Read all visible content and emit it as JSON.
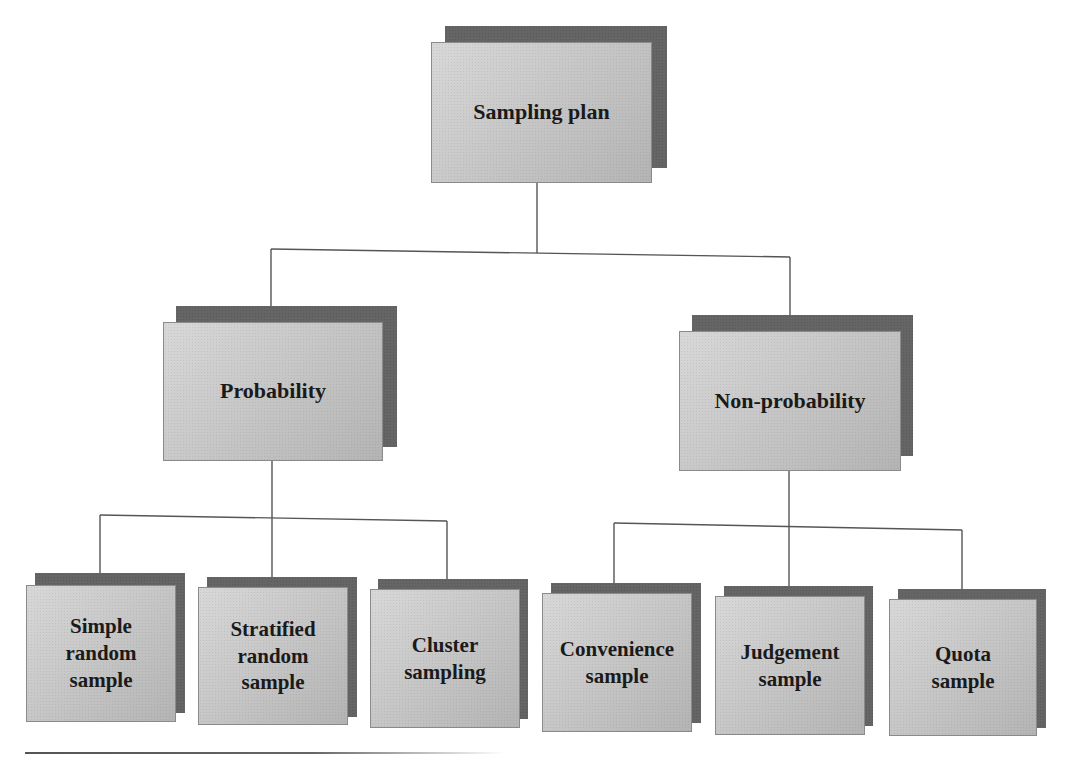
{
  "diagram": {
    "type": "hierarchy-tree",
    "colors": {
      "box_fill": "#c6c6c6",
      "box_shadow": "#656565",
      "connector": "#555555",
      "text": "#1a1a1a",
      "background": "#ffffff"
    },
    "root": {
      "label": "Sampling plan"
    },
    "branches": [
      {
        "label": "Probability",
        "children": [
          {
            "label": "Simple\nrandom\nsample"
          },
          {
            "label": "Stratified\nrandom\nsample"
          },
          {
            "label": "Cluster\nsampling"
          }
        ]
      },
      {
        "label": "Non-probability",
        "children": [
          {
            "label": "Convenience\nsample"
          },
          {
            "label": "Judgement\nsample"
          },
          {
            "label": "Quota\nsample"
          }
        ]
      }
    ]
  }
}
